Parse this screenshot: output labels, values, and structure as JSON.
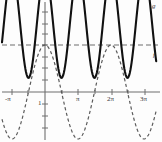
{
  "chart_data": {
    "type": "line",
    "title": "",
    "xlabel": "",
    "ylabel": "",
    "xlim": [
      -4.4,
      10.6
    ],
    "ylim": [
      -1.45,
      2.75
    ],
    "grid": false,
    "legend": "inline-curve-labels",
    "x_ticks": [
      -3.14159,
      3.14159,
      6.28319,
      9.42478
    ],
    "x_tick_labels": [
      "-π",
      "π",
      "2π",
      "3π"
    ],
    "y_ticks": [
      -1,
      1
    ],
    "y_tick_labels": [
      "1"
    ],
    "annotations": [
      {
        "name": "asymptote-line",
        "type": "horizontal-dashed-line",
        "y": 1.0
      },
      {
        "name": "curve-label-g",
        "text": "g",
        "x": 10.2,
        "y": 2.55
      },
      {
        "name": "curve-label-f",
        "text": "f",
        "x": 10.2,
        "y": 1.05
      }
    ],
    "series": [
      {
        "name": "f",
        "label": "f",
        "style": "dashed",
        "color": "#5a5a5a",
        "formula": "cos(x)",
        "period": 6.28319,
        "amplitude": 1,
        "min": -1,
        "max": 1
      },
      {
        "name": "g",
        "label": "g",
        "style": "solid",
        "color": "#111111",
        "formula": "1 + cos(x)^2 * 1.5",
        "period": 3.14159,
        "min": 0.3,
        "max": 2.55
      }
    ]
  },
  "axes": {
    "x_axis_label": "",
    "y_axis_label": "",
    "origin_label": ""
  },
  "colors": {
    "axis": "#6f6f6f",
    "solid_curve": "#111111",
    "dashed_curve": "#5a5a5a",
    "asymptote": "#6f6f6f",
    "background": "#fdfdfd",
    "text": "#333333"
  }
}
